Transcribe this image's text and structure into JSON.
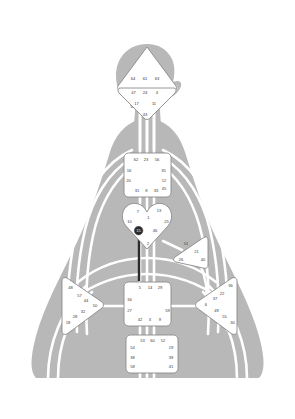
{
  "chart_data": {
    "type": "diagram",
    "subtitle": "Body silhouette with nine energy centers and numbered gates",
    "body_color": "#b8b8b8",
    "channel_color": "#ffffff",
    "center_fill": "#ffffff",
    "center_stroke": "#8a8a8a",
    "gate_text_color": "#3a3a3a",
    "defined_gate_color": "#2a2a2a",
    "background": "#ffffff",
    "centers": [
      {
        "id": "head",
        "name": "Head Center",
        "shape": "triangle-up",
        "state": "undefined",
        "gates": [
          {
            "number": "64",
            "x": 133.0,
            "y": 79.0,
            "defined": false
          },
          {
            "number": "61",
            "x": 145.0,
            "y": 79.0,
            "defined": false
          },
          {
            "number": "63",
            "x": 157.0,
            "y": 79.0,
            "defined": false
          }
        ]
      },
      {
        "id": "ajna",
        "name": "Ajna Center",
        "shape": "triangle-down",
        "state": "undefined",
        "gates": [
          {
            "number": "47",
            "x": 133.5,
            "y": 92.5,
            "defined": false
          },
          {
            "number": "24",
            "x": 145.0,
            "y": 92.5,
            "defined": false
          },
          {
            "number": "4",
            "x": 157.0,
            "y": 92.5,
            "defined": false
          },
          {
            "number": "17",
            "x": 136.5,
            "y": 104.0,
            "defined": false
          },
          {
            "number": "11",
            "x": 154.0,
            "y": 104.0,
            "defined": false
          },
          {
            "number": "43",
            "x": 145.0,
            "y": 114.5,
            "defined": false
          }
        ]
      },
      {
        "id": "throat",
        "name": "Throat Center",
        "shape": "square",
        "state": "undefined",
        "gates": [
          {
            "number": "62",
            "x": 136.0,
            "y": 159.5,
            "defined": false
          },
          {
            "number": "23",
            "x": 146.0,
            "y": 159.5,
            "defined": false
          },
          {
            "number": "56",
            "x": 157.0,
            "y": 159.5,
            "defined": false
          },
          {
            "number": "16",
            "x": 129.0,
            "y": 170.5,
            "defined": false
          },
          {
            "number": "35",
            "x": 163.5,
            "y": 170.5,
            "defined": false
          },
          {
            "number": "20",
            "x": 128.5,
            "y": 181.0,
            "defined": false
          },
          {
            "number": "12",
            "x": 164.0,
            "y": 181.0,
            "defined": false
          },
          {
            "number": "31",
            "x": 137.0,
            "y": 191.0,
            "defined": false
          },
          {
            "number": "8",
            "x": 146.5,
            "y": 191.0,
            "defined": false
          },
          {
            "number": "33",
            "x": 156.0,
            "y": 191.0,
            "defined": false
          },
          {
            "number": "45",
            "x": 164.0,
            "y": 189.0,
            "defined": false
          }
        ]
      },
      {
        "id": "g",
        "name": "G Center / Identity",
        "shape": "heart",
        "state": "undefined",
        "gates": [
          {
            "number": "7",
            "x": 138.0,
            "y": 212.0,
            "defined": false
          },
          {
            "number": "13",
            "x": 159.0,
            "y": 211.0,
            "defined": false
          },
          {
            "number": "1",
            "x": 148.5,
            "y": 218.0,
            "defined": false
          },
          {
            "number": "10",
            "x": 129.5,
            "y": 221.5,
            "defined": false
          },
          {
            "number": "25",
            "x": 166.5,
            "y": 222.0,
            "defined": false
          },
          {
            "number": "15",
            "x": 138.5,
            "y": 231.0,
            "defined": true
          },
          {
            "number": "46",
            "x": 155.0,
            "y": 231.0,
            "defined": false
          },
          {
            "number": "2",
            "x": 148.0,
            "y": 243.5,
            "defined": false
          }
        ]
      },
      {
        "id": "heart",
        "name": "Heart / Ego Center",
        "shape": "triangle-left",
        "state": "undefined",
        "gates": [
          {
            "number": "51",
            "x": 186.0,
            "y": 244.0,
            "defined": false
          },
          {
            "number": "21",
            "x": 196.5,
            "y": 252.0,
            "defined": false
          },
          {
            "number": "26",
            "x": 181.0,
            "y": 259.5,
            "defined": false
          },
          {
            "number": "40",
            "x": 203.0,
            "y": 259.5,
            "defined": false
          }
        ]
      },
      {
        "id": "spleen",
        "name": "Spleen Center",
        "shape": "triangle-right",
        "state": "undefined",
        "gates": [
          {
            "number": "48",
            "x": 70.5,
            "y": 288.0,
            "defined": false
          },
          {
            "number": "57",
            "x": 79.5,
            "y": 296.0,
            "defined": false
          },
          {
            "number": "44",
            "x": 86.0,
            "y": 301.0,
            "defined": false
          },
          {
            "number": "50",
            "x": 95.0,
            "y": 306.0,
            "defined": false
          },
          {
            "number": "32",
            "x": 83.0,
            "y": 311.5,
            "defined": false
          },
          {
            "number": "28",
            "x": 75.0,
            "y": 317.0,
            "defined": false
          },
          {
            "number": "18",
            "x": 68.0,
            "y": 323.0,
            "defined": false
          }
        ]
      },
      {
        "id": "solar-plexus",
        "name": "Solar Plexus / Emotional Center",
        "shape": "triangle-left",
        "state": "undefined",
        "gates": [
          {
            "number": "36",
            "x": 230.5,
            "y": 286.0,
            "defined": false
          },
          {
            "number": "22",
            "x": 222.0,
            "y": 294.0,
            "defined": false
          },
          {
            "number": "37",
            "x": 215.0,
            "y": 299.0,
            "defined": false
          },
          {
            "number": "6",
            "x": 206.0,
            "y": 304.5,
            "defined": false
          },
          {
            "number": "49",
            "x": 216.5,
            "y": 311.0,
            "defined": false
          },
          {
            "number": "55",
            "x": 224.5,
            "y": 317.0,
            "defined": false
          },
          {
            "number": "30",
            "x": 232.5,
            "y": 322.5,
            "defined": false
          }
        ]
      },
      {
        "id": "sacral",
        "name": "Sacral Center",
        "shape": "square",
        "state": "undefined",
        "gates": [
          {
            "number": "5",
            "x": 140.0,
            "y": 288.0,
            "defined": false
          },
          {
            "number": "14",
            "x": 150.0,
            "y": 288.0,
            "defined": false
          },
          {
            "number": "29",
            "x": 160.0,
            "y": 288.0,
            "defined": false
          },
          {
            "number": "34",
            "x": 129.5,
            "y": 300.0,
            "defined": false
          },
          {
            "number": "27",
            "x": 129.5,
            "y": 311.0,
            "defined": false
          },
          {
            "number": "59",
            "x": 167.5,
            "y": 311.0,
            "defined": false
          },
          {
            "number": "42",
            "x": 140.0,
            "y": 320.0,
            "defined": false
          },
          {
            "number": "3",
            "x": 150.0,
            "y": 320.0,
            "defined": false
          },
          {
            "number": "9",
            "x": 160.0,
            "y": 320.0,
            "defined": false
          }
        ]
      },
      {
        "id": "root",
        "name": "Root Center",
        "shape": "square",
        "state": "undefined",
        "gates": [
          {
            "number": "53",
            "x": 142.5,
            "y": 341.0,
            "defined": false
          },
          {
            "number": "60",
            "x": 152.5,
            "y": 341.0,
            "defined": false
          },
          {
            "number": "52",
            "x": 163.0,
            "y": 341.0,
            "defined": false
          },
          {
            "number": "54",
            "x": 132.5,
            "y": 347.5,
            "defined": false
          },
          {
            "number": "19",
            "x": 171.0,
            "y": 348.0,
            "defined": false
          },
          {
            "number": "38",
            "x": 132.5,
            "y": 357.5,
            "defined": false
          },
          {
            "number": "39",
            "x": 171.0,
            "y": 357.5,
            "defined": false
          },
          {
            "number": "58",
            "x": 132.5,
            "y": 367.0,
            "defined": false
          },
          {
            "number": "41",
            "x": 171.0,
            "y": 367.0,
            "defined": false
          }
        ]
      }
    ],
    "activated_channels": [
      {
        "from_gate": "15",
        "to_gate": "",
        "x": 139.0,
        "y1": 233.0,
        "y2": 280.0,
        "color": "#2a2a2a"
      }
    ]
  }
}
